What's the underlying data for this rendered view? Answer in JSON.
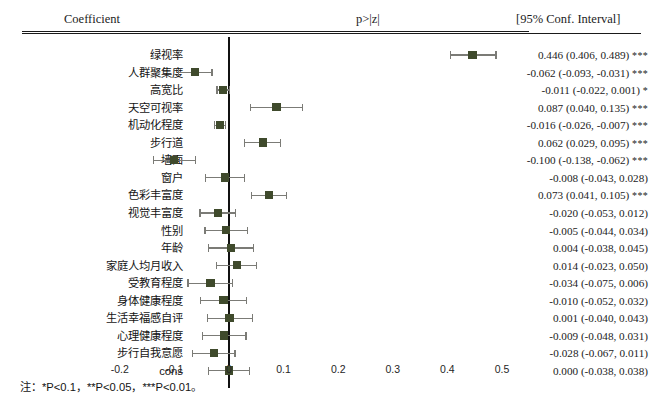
{
  "header": {
    "coefficient_label": "Coefficient",
    "pvalue_label": "p>|z|",
    "ci_label": "[95% Conf. Interval]"
  },
  "footnote": "注：*P<0.1，**P<0.05，***P<0.01。",
  "style": {
    "marker_color": "#3f4a2c",
    "errorbar_color": "#7b7b76",
    "zero_line_color": "#111111"
  },
  "chart_data": {
    "type": "scatter",
    "title": "",
    "subtitle": "",
    "xlabel": "",
    "ylabel": "",
    "xlim": [
      -0.25,
      0.53
    ],
    "xticks": [
      -0.2,
      -0.1,
      0,
      0.1,
      0.2,
      0.3,
      0.4,
      0.5
    ],
    "xticklabels": [
      "-0.2",
      "-0.1",
      "0",
      "0.1",
      "0.2",
      "0.3",
      "0.4",
      "0.5"
    ],
    "grid": false,
    "legend": "none",
    "reference_line": 0,
    "categories": [
      "绿视率",
      "人群聚集度",
      "高宽比",
      "天空可视率",
      "机动化程度",
      "步行道",
      "墙面",
      "窗户",
      "色彩丰富度",
      "视觉丰富度",
      "性别",
      "年龄",
      "家庭人均月收入",
      "受教育程度",
      "身体健康程度",
      "生活幸福感自评",
      "心理健康程度",
      "步行自我意愿",
      "cons"
    ],
    "rows": [
      {
        "label": "绿视率",
        "coef": 0.446,
        "low": 0.406,
        "high": 0.489,
        "stars": "***",
        "value_text": "0.446 (0.406, 0.489)"
      },
      {
        "label": "人群聚集度",
        "coef": -0.062,
        "low": -0.093,
        "high": -0.031,
        "stars": "***",
        "value_text": "-0.062 (-0.093, -0.031)"
      },
      {
        "label": "高宽比",
        "coef": -0.011,
        "low": -0.022,
        "high": 0.001,
        "stars": "*",
        "value_text": "-0.011 (-0.022, 0.001)"
      },
      {
        "label": "天空可视率",
        "coef": 0.087,
        "low": 0.04,
        "high": 0.135,
        "stars": "***",
        "value_text": "0.087 (0.040, 0.135)"
      },
      {
        "label": "机动化程度",
        "coef": -0.016,
        "low": -0.026,
        "high": -0.007,
        "stars": "***",
        "value_text": "-0.016 (-0.026, -0.007)"
      },
      {
        "label": "步行道",
        "coef": 0.062,
        "low": 0.029,
        "high": 0.095,
        "stars": "***",
        "value_text": "0.062 (0.029, 0.095)"
      },
      {
        "label": "墙面",
        "coef": -0.1,
        "low": -0.138,
        "high": -0.062,
        "stars": "***",
        "value_text": "-0.100 (-0.138, -0.062)"
      },
      {
        "label": "窗户",
        "coef": -0.008,
        "low": -0.043,
        "high": 0.028,
        "stars": "",
        "value_text": "-0.008 (-0.043, 0.028)"
      },
      {
        "label": "色彩丰富度",
        "coef": 0.073,
        "low": 0.041,
        "high": 0.105,
        "stars": "***",
        "value_text": "0.073 (0.041, 0.105)"
      },
      {
        "label": "视觉丰富度",
        "coef": -0.02,
        "low": -0.053,
        "high": 0.012,
        "stars": "",
        "value_text": "-0.020 (-0.053, 0.012)"
      },
      {
        "label": "性别",
        "coef": -0.005,
        "low": -0.044,
        "high": 0.034,
        "stars": "",
        "value_text": "-0.005 (-0.044, 0.034)"
      },
      {
        "label": "年龄",
        "coef": 0.004,
        "low": -0.038,
        "high": 0.045,
        "stars": "",
        "value_text": "0.004 (-0.038, 0.045)"
      },
      {
        "label": "家庭人均月收入",
        "coef": 0.014,
        "low": -0.023,
        "high": 0.05,
        "stars": "",
        "value_text": "0.014 (-0.023, 0.050)"
      },
      {
        "label": "受教育程度",
        "coef": -0.034,
        "low": -0.075,
        "high": 0.006,
        "stars": "",
        "value_text": "-0.034 (-0.075, 0.006)"
      },
      {
        "label": "身体健康程度",
        "coef": -0.01,
        "low": -0.052,
        "high": 0.032,
        "stars": "",
        "value_text": "-0.010 (-0.052, 0.032)"
      },
      {
        "label": "生活幸福感自评",
        "coef": 0.001,
        "low": -0.04,
        "high": 0.043,
        "stars": "",
        "value_text": "0.001 (-0.040, 0.043)"
      },
      {
        "label": "心理健康程度",
        "coef": -0.009,
        "low": -0.048,
        "high": 0.031,
        "stars": "",
        "value_text": "-0.009 (-0.048, 0.031)"
      },
      {
        "label": "步行自我意愿",
        "coef": -0.028,
        "low": -0.067,
        "high": 0.011,
        "stars": "",
        "value_text": "-0.028 (-0.067, 0.011)"
      },
      {
        "label": "cons",
        "coef": 0.0,
        "low": -0.038,
        "high": 0.038,
        "stars": "",
        "value_text": "0.000 (-0.038, 0.038)"
      }
    ]
  }
}
